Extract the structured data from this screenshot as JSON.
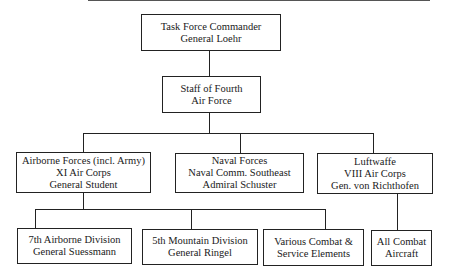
{
  "chart": {
    "top": {
      "line1": "Task Force Commander",
      "line2": "General Loehr"
    },
    "staff": {
      "line1": "Staff of Fourth",
      "line2": "Air Force"
    },
    "branches": [
      {
        "line1": "Airborne Forces (incl. Army)",
        "line2": "XI Air Corps",
        "line3": "General Student"
      },
      {
        "line1": "Naval Forces",
        "line2": "Naval Comm. Southeast",
        "line3": "Admiral Schuster"
      },
      {
        "line1": "Luftwaffe",
        "line2": "VIII Air Corps",
        "line3": "Gen. von Richthofen"
      }
    ],
    "units": [
      {
        "line1": "7th Airborne Division",
        "line2": "General Suessmann"
      },
      {
        "line1": "5th Mountain Division",
        "line2": "General Ringel"
      },
      {
        "line1": "Various Combat &",
        "line2": "Service Elements"
      },
      {
        "line1": "All Combat",
        "line2": "Aircraft"
      }
    ]
  }
}
